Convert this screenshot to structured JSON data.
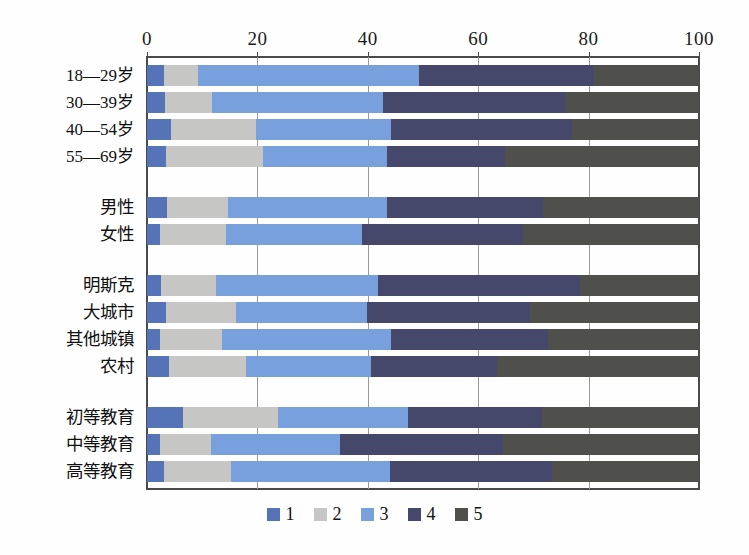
{
  "chart_data": {
    "type": "bar",
    "orientation": "horizontal",
    "stacked": true,
    "stack_mode": "percent",
    "title": "",
    "subtitle": "",
    "xlabel": "",
    "ylabel": "",
    "xlim": [
      0,
      100
    ],
    "xticks": [
      0,
      20,
      40,
      60,
      80,
      100
    ],
    "xtick_labels": [
      "0",
      "20",
      "40",
      "60",
      "80",
      "100"
    ],
    "grid": true,
    "grid_axis": "x",
    "legend_position": "bottom",
    "legend": [
      "1",
      "2",
      "3",
      "4",
      "5"
    ],
    "colors": [
      "#5574b8",
      "#c6c6c4",
      "#77a0dd",
      "#45476b",
      "#4f504b"
    ],
    "groups": [
      {
        "name": "age",
        "categories": [
          "18—29岁",
          "30—39岁",
          "40—54岁",
          "55—69岁"
        ]
      },
      {
        "name": "gender",
        "categories": [
          "男性",
          "女性"
        ]
      },
      {
        "name": "settlement",
        "categories": [
          "明斯克",
          "大城市",
          "其他城镇",
          "农村"
        ]
      },
      {
        "name": "education",
        "categories": [
          "初等教育",
          "中等教育",
          "高等教育"
        ]
      }
    ],
    "categories": [
      "18—29岁",
      "30—39岁",
      "40—54岁",
      "55—69岁",
      "男性",
      "女性",
      "明斯克",
      "大城市",
      "其他城镇",
      "农村",
      "初等教育",
      "中等教育",
      "高等教育"
    ],
    "series": [
      {
        "name": "1",
        "color": "#5574b8",
        "values": [
          3.0,
          3.2,
          4.3,
          3.4,
          3.6,
          2.4,
          2.5,
          3.4,
          2.4,
          4.0,
          6.5,
          2.4,
          3.0
        ]
      },
      {
        "name": "2",
        "color": "#c6c6c4",
        "values": [
          6.2,
          8.5,
          15.5,
          17.6,
          11.1,
          12.0,
          10.0,
          12.7,
          11.1,
          13.9,
          17.2,
          9.2,
          12.3
        ]
      },
      {
        "name": "3",
        "color": "#77a0dd",
        "values": [
          40.0,
          31.1,
          24.4,
          22.4,
          28.8,
          24.6,
          29.4,
          23.8,
          30.7,
          22.7,
          23.6,
          23.4,
          28.7
        ]
      },
      {
        "name": "4",
        "color": "#45476b",
        "values": [
          31.7,
          33.0,
          32.8,
          21.5,
          28.3,
          29.1,
          36.6,
          29.5,
          28.5,
          22.8,
          24.3,
          29.5,
          29.4
        ]
      },
      {
        "name": "5",
        "color": "#4f504b",
        "values": [
          19.1,
          24.2,
          23.0,
          35.1,
          28.2,
          31.9,
          21.5,
          30.6,
          27.3,
          36.6,
          28.4,
          35.5,
          26.6
        ]
      }
    ],
    "rows": [
      {
        "label": "18—29岁",
        "group": "age",
        "values": [
          3.0,
          6.2,
          40.0,
          31.7,
          19.1
        ]
      },
      {
        "label": "30—39岁",
        "group": "age",
        "values": [
          3.2,
          8.5,
          31.1,
          33.0,
          24.2
        ]
      },
      {
        "label": "40—54岁",
        "group": "age",
        "values": [
          4.3,
          15.5,
          24.4,
          32.8,
          23.0
        ]
      },
      {
        "label": "55—69岁",
        "group": "age",
        "values": [
          3.4,
          17.6,
          22.4,
          21.5,
          35.1
        ]
      },
      {
        "label": "男性",
        "group": "gender",
        "values": [
          3.6,
          11.1,
          28.8,
          28.3,
          28.2
        ]
      },
      {
        "label": "女性",
        "group": "gender",
        "values": [
          2.4,
          12.0,
          24.6,
          29.1,
          31.9
        ]
      },
      {
        "label": "明斯克",
        "group": "settlement",
        "values": [
          2.5,
          10.0,
          29.4,
          36.6,
          21.5
        ]
      },
      {
        "label": "大城市",
        "group": "settlement",
        "values": [
          3.4,
          12.7,
          23.8,
          29.5,
          30.6
        ]
      },
      {
        "label": "其他城镇",
        "group": "settlement",
        "values": [
          2.4,
          11.1,
          30.7,
          28.5,
          27.3
        ]
      },
      {
        "label": "农村",
        "group": "settlement",
        "values": [
          4.0,
          13.9,
          22.7,
          22.8,
          36.6
        ]
      },
      {
        "label": "初等教育",
        "group": "education",
        "values": [
          6.5,
          17.2,
          23.6,
          24.3,
          28.4
        ]
      },
      {
        "label": "中等教育",
        "group": "education",
        "values": [
          2.4,
          9.2,
          23.4,
          29.5,
          35.5
        ]
      },
      {
        "label": "高等教育",
        "group": "education",
        "values": [
          3.0,
          12.3,
          28.7,
          29.4,
          26.6
        ]
      }
    ]
  }
}
